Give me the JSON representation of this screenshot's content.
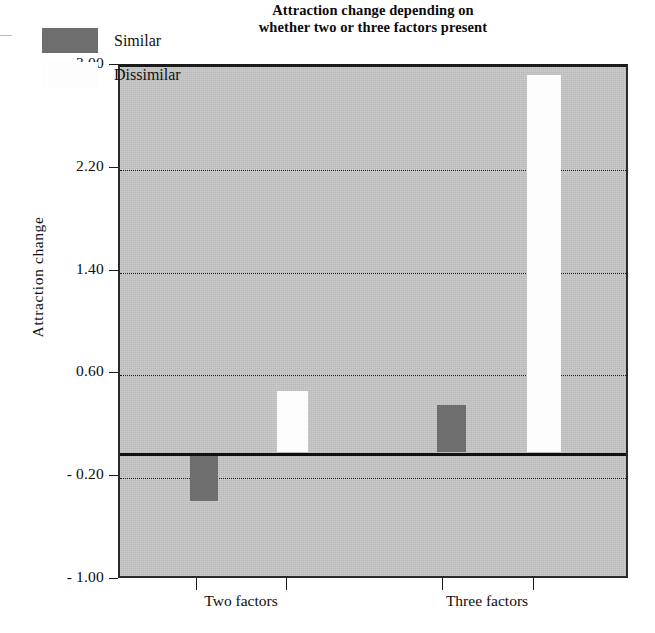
{
  "chart_data": {
    "type": "bar",
    "title": "Attraction change depending on whether two or three factors present",
    "title_line1": "Attraction change depending on",
    "title_line2": "whether two or three factors present",
    "xlabel": "",
    "ylabel": "Attraction  change",
    "categories": [
      "Two factors",
      "Three factors"
    ],
    "series": [
      {
        "name": "Similar",
        "color": "#6e6e6e",
        "values": [
          -0.38,
          0.37
        ]
      },
      {
        "name": "Dissimilar",
        "color": "#fdfdfd",
        "values": [
          0.48,
          2.94
        ]
      }
    ],
    "ylim": [
      -1.0,
      3.0
    ],
    "ytick_labels": [
      "3.00",
      "2.20",
      "1.40",
      "0.60",
      "- 0.20",
      "- 1.00"
    ],
    "ytick_values": [
      3.0,
      2.2,
      1.4,
      0.6,
      -0.2,
      -1.0
    ],
    "gridlines": true,
    "gridline_values": [
      2.2,
      1.4,
      0.6,
      -0.2
    ],
    "zero_line": 0,
    "legend_position": "top-left",
    "plot_background": "#c6c6c6"
  },
  "legend": {
    "items": [
      {
        "label": "Similar",
        "swatch": "#6e6e6e"
      },
      {
        "label": "Dissimilar",
        "swatch": "#fdfdfd"
      }
    ]
  }
}
